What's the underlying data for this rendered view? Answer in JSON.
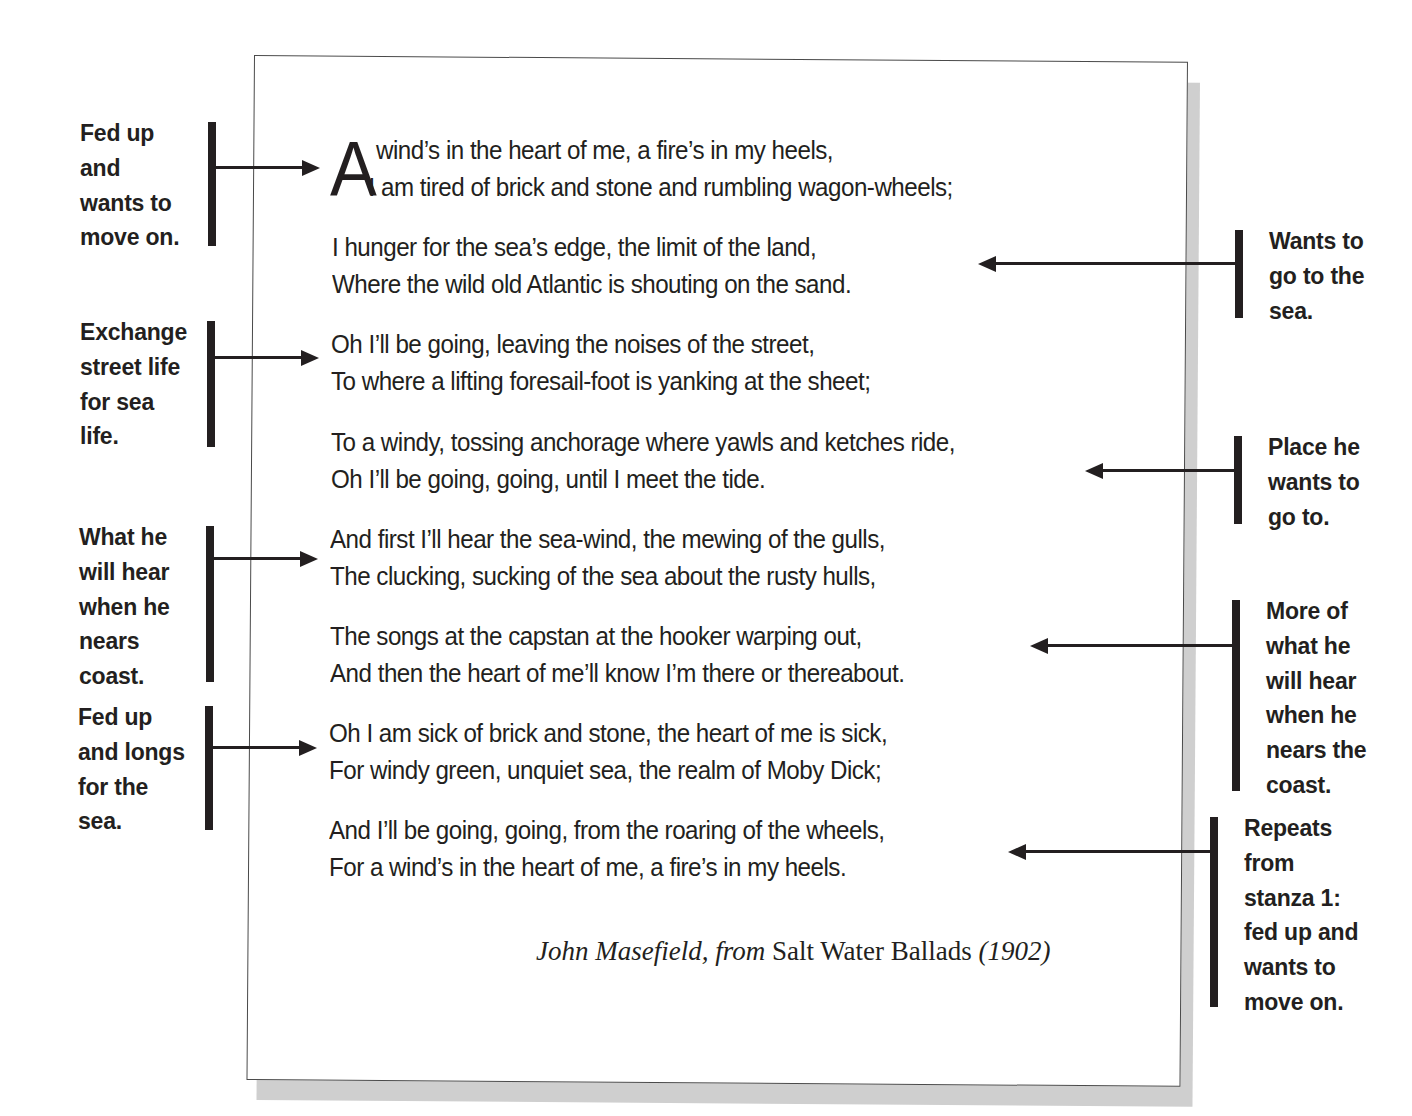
{
  "poem": {
    "dropcap": "A",
    "stanzas": [
      {
        "line1": "wind’s in the heart of me, a fire’s in my heels,",
        "line2": "I am tired of brick and stone and rumbling wagon-wheels;"
      },
      {
        "line1": "I hunger for the sea’s edge, the limit of the land,",
        "line2": "Where the wild old Atlantic is shouting on the sand."
      },
      {
        "line1": "Oh I’ll be going, leaving the noises of the street,",
        "line2": "To where a lifting foresail-foot is yanking at the sheet;"
      },
      {
        "line1": "To a windy, tossing anchorage where yawls and ketches ride,",
        "line2": "Oh I’ll be going, going, until I meet the tide."
      },
      {
        "line1": "And first I’ll hear the sea-wind, the mewing of the gulls,",
        "line2": "The clucking, sucking of the sea about the rusty hulls,"
      },
      {
        "line1": "The songs at the capstan at the hooker warping out,",
        "line2": "And then the heart of me’ll know I’m there or thereabout."
      },
      {
        "line1": "Oh I am sick of brick and stone, the heart of me is sick,",
        "line2": "For windy green, unquiet sea, the realm of Moby Dick;"
      },
      {
        "line1": "And I’ll be going, going, from the roaring of the wheels,",
        "line2": "For a wind’s in the heart of me, a fire’s in my heels."
      }
    ],
    "attribution": {
      "author": "John Masefield,",
      "from": "from",
      "book": "Salt Water Ballads",
      "year": "(1902)"
    }
  },
  "annotations": {
    "left": [
      {
        "lines": [
          "Fed up",
          "and",
          "wants to",
          "move on."
        ]
      },
      {
        "lines": [
          "Exchange",
          "street life",
          "for sea",
          "life."
        ]
      },
      {
        "lines": [
          "What he",
          "will hear",
          "when he",
          "nears",
          "coast."
        ]
      },
      {
        "lines": [
          "Fed up",
          "and longs",
          "for the",
          "sea."
        ]
      }
    ],
    "right": [
      {
        "lines": [
          "Wants to",
          "go to the",
          "sea."
        ]
      },
      {
        "lines": [
          "Place he",
          "wants to",
          "go to."
        ]
      },
      {
        "lines": [
          "More of",
          "what he",
          "will hear",
          "when he",
          "nears the",
          "coast."
        ]
      },
      {
        "lines": [
          "Repeats",
          "from",
          "stanza 1:",
          "fed up and",
          "wants to",
          "move on."
        ]
      }
    ]
  },
  "colors": {
    "ink": "#231f20",
    "frame": "#4a4a4a",
    "shadow": "#cfcfcf",
    "background": "#ffffff"
  }
}
